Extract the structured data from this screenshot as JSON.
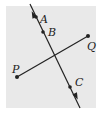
{
  "diagram": {
    "type": "geometry",
    "background_color": "#e9e9e9",
    "line_color": "#222222",
    "line": {
      "name": "line-ABC",
      "from": [
        30,
        4
      ],
      "to": [
        80,
        108
      ],
      "arrows": "both",
      "points": [
        {
          "label": "A",
          "x": 36,
          "y": 17,
          "label_x": 40,
          "label_y": 21
        },
        {
          "label": "B",
          "x": 43,
          "y": 32,
          "label_x": 48,
          "label_y": 35
        },
        {
          "label": "C",
          "x": 70,
          "y": 87,
          "label_x": 75,
          "label_y": 84
        }
      ]
    },
    "segment": {
      "name": "segment-PQ",
      "from": {
        "label": "P",
        "x": 17,
        "y": 77,
        "label_x": 13,
        "label_y": 72
      },
      "to": {
        "label": "Q",
        "x": 88,
        "y": 36,
        "label_x": 88,
        "label_y": 48
      }
    }
  }
}
